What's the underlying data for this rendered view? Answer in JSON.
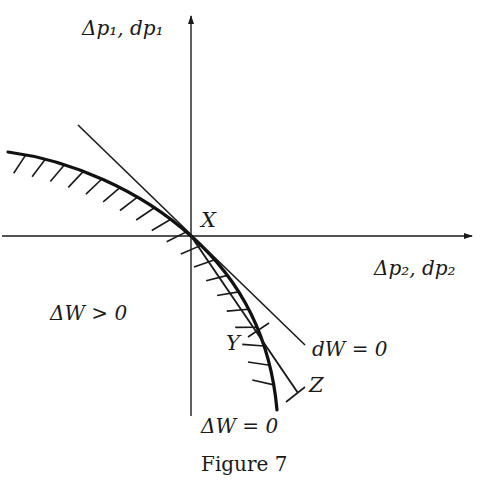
{
  "figure": {
    "caption": "Figure 7",
    "axes": {
      "vertical_label": "Δp₁, dp₁",
      "horizontal_label": "Δp₂, dp₂"
    },
    "points": {
      "origin": "X",
      "chord_mid": "Y",
      "chord_end": "Z"
    },
    "curves": {
      "indifference_curve_label": "ΔW = 0",
      "tangent_line_label": "dW = 0"
    },
    "region_label": "ΔW > 0"
  }
}
